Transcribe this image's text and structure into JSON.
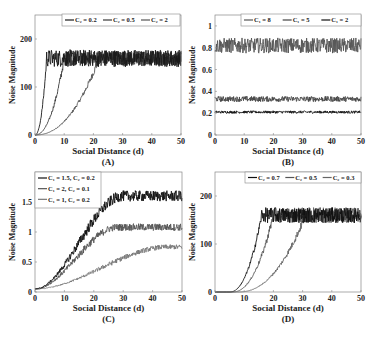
{
  "figure": {
    "panels": [
      {
        "id": "A",
        "label": "(A)",
        "xlabel": "Social Distance (d)",
        "ylabel": "Noise Magnitude",
        "box": {
          "left": 35,
          "top": 15,
          "right": 181,
          "bottom": 135
        },
        "xlim": [
          0,
          50
        ],
        "ylim": [
          0,
          250
        ],
        "xticks": [
          0,
          10,
          20,
          30,
          40,
          50
        ],
        "yticks": [
          0,
          100,
          200
        ],
        "legend": {
          "layout": "row",
          "x": 62,
          "y": 14,
          "w": 118,
          "h": 12,
          "entries": [
            "C₂ = 0.2",
            "C₂ = 0.5",
            "C₂ = 2"
          ]
        },
        "series": [
          {
            "name": "C₂ = 0.2",
            "color": "#1a1a1a",
            "plateau": 160,
            "rise_start": 0,
            "rise_end": 4,
            "noise": 18,
            "shape": "power"
          },
          {
            "name": "C₂ = 0.5",
            "color": "#3a3a3a",
            "plateau": 160,
            "rise_start": 0,
            "rise_end": 10,
            "noise": 16,
            "shape": "power"
          },
          {
            "name": "C₂ = 2",
            "color": "#555555",
            "plateau": 160,
            "rise_start": 0,
            "rise_end": 22,
            "noise": 14,
            "shape": "power"
          }
        ]
      },
      {
        "id": "B",
        "label": "(B)",
        "xlabel": "Social Distance (d)",
        "ylabel": "Noise Magnitude",
        "box": {
          "left": 215,
          "top": 15,
          "right": 361,
          "bottom": 135
        },
        "xlim": [
          0,
          50
        ],
        "ylim": [
          0,
          1.1
        ],
        "xticks": [
          0,
          10,
          20,
          30,
          40,
          50
        ],
        "yticks": [
          0,
          0.2,
          0.4,
          0.6,
          0.8,
          1
        ],
        "legend": {
          "layout": "row",
          "x": 241,
          "y": 14,
          "w": 120,
          "h": 12,
          "entries": [
            "C₁ = 8",
            "C₁ = 5",
            "C₁ = 2"
          ]
        },
        "series": [
          {
            "name": "C₁ = 8",
            "color": "#555555",
            "plateau": 0.82,
            "rise_start": 0,
            "rise_end": 0,
            "noise": 0.07,
            "shape": "flat"
          },
          {
            "name": "C₁ = 5",
            "color": "#444444",
            "plateau": 0.33,
            "rise_start": 0,
            "rise_end": 0,
            "noise": 0.025,
            "shape": "flat"
          },
          {
            "name": "C₁ = 2",
            "color": "#111111",
            "plateau": 0.21,
            "rise_start": 0,
            "rise_end": 0,
            "noise": 0.012,
            "shape": "flat"
          }
        ]
      },
      {
        "id": "C",
        "label": "(C)",
        "xlabel": "Social Distance (d)",
        "ylabel": "Noise Magnitude",
        "box": {
          "left": 35,
          "top": 172,
          "right": 182,
          "bottom": 292
        },
        "xlim": [
          0,
          50
        ],
        "ylim": [
          0,
          2
        ],
        "xticks": [
          0,
          10,
          20,
          30,
          40,
          50
        ],
        "yticks": [
          0,
          0.5,
          1,
          1.5
        ],
        "legend": {
          "layout": "column",
          "x": 35,
          "y": 172,
          "w": 66,
          "h": 36,
          "entries": [
            "C₁ = 1.5, C₂ = 0.2",
            "C₁ = 2, C₂ = 0.1",
            "C₁ = 1, C₂ = 0.2"
          ]
        },
        "series": [
          {
            "name": "C₁ = 1.5, C₂ = 0.2",
            "color": "#111111",
            "plateau": 1.6,
            "base": 0.05,
            "rise_start": 0,
            "rise_end": 30,
            "noise": 0.09,
            "shape": "sigmoid"
          },
          {
            "name": "C₁ = 2, C₂ = 0.1",
            "color": "#555555",
            "plateau": 1.08,
            "base": 0.05,
            "rise_start": 0,
            "rise_end": 28,
            "noise": 0.06,
            "shape": "sigmoid"
          },
          {
            "name": "C₁ = 1, C₂ = 0.2",
            "color": "#777777",
            "plateau": 0.75,
            "base": 0.05,
            "rise_start": 0,
            "rise_end": 45,
            "noise": 0.04,
            "shape": "sigmoid"
          }
        ]
      },
      {
        "id": "D",
        "label": "(D)",
        "xlabel": "Social Distance (d)",
        "ylabel": "Noise Magnitude",
        "box": {
          "left": 215,
          "top": 172,
          "right": 361,
          "bottom": 292
        },
        "xlim": [
          0,
          50
        ],
        "ylim": [
          0,
          250
        ],
        "xticks": [
          0,
          10,
          20,
          30,
          40,
          50
        ],
        "yticks": [
          0,
          100,
          200
        ],
        "legend": {
          "layout": "row",
          "x": 245,
          "y": 172,
          "w": 116,
          "h": 11,
          "entries": [
            "C₂ = 0.7",
            "C₂ = 0.5",
            "C₂ = 0.3"
          ]
        },
        "series": [
          {
            "name": "C₂ = 0.7",
            "color": "#111111",
            "plateau": 160,
            "rise_start": 5,
            "rise_end": 16,
            "noise": 16,
            "shape": "power"
          },
          {
            "name": "C₂ = 0.5",
            "color": "#555555",
            "plateau": 160,
            "rise_start": 6,
            "rise_end": 20,
            "noise": 16,
            "shape": "power"
          },
          {
            "name": "C₂ = 0.3",
            "color": "#666666",
            "plateau": 160,
            "rise_start": 8,
            "rise_end": 31,
            "noise": 16,
            "shape": "power"
          }
        ]
      }
    ]
  },
  "chart_data": [
    {
      "type": "line",
      "title": "(A)",
      "xlabel": "Social Distance (d)",
      "ylabel": "Noise Magnitude",
      "xlim": [
        0,
        50
      ],
      "ylim": [
        0,
        250
      ],
      "x": [
        0,
        2,
        4,
        6,
        10,
        15,
        20,
        25,
        30,
        40,
        50
      ],
      "series": [
        {
          "name": "C2 = 0.2",
          "values": [
            0,
            80,
            155,
            165,
            160,
            165,
            160,
            165,
            160,
            162,
            160
          ]
        },
        {
          "name": "C2 = 0.5",
          "values": [
            0,
            10,
            40,
            90,
            155,
            165,
            160,
            165,
            160,
            162,
            160
          ]
        },
        {
          "name": "C2 = 2",
          "values": [
            0,
            2,
            8,
            15,
            40,
            80,
            140,
            160,
            160,
            162,
            160
          ]
        }
      ],
      "legend_position": "top-right"
    },
    {
      "type": "line",
      "title": "(B)",
      "xlabel": "Social Distance (d)",
      "ylabel": "Noise Magnitude",
      "xlim": [
        0,
        50
      ],
      "ylim": [
        0,
        1.1
      ],
      "x": [
        0,
        10,
        20,
        30,
        40,
        50
      ],
      "series": [
        {
          "name": "C1 = 8",
          "values": [
            0.82,
            0.82,
            0.82,
            0.82,
            0.82,
            0.82
          ]
        },
        {
          "name": "C1 = 5",
          "values": [
            0.33,
            0.33,
            0.33,
            0.33,
            0.33,
            0.33
          ]
        },
        {
          "name": "C1 = 2",
          "values": [
            0.21,
            0.21,
            0.21,
            0.21,
            0.21,
            0.21
          ]
        }
      ],
      "legend_position": "top-right"
    },
    {
      "type": "line",
      "title": "(C)",
      "xlabel": "Social Distance (d)",
      "ylabel": "Noise Magnitude",
      "xlim": [
        0,
        50
      ],
      "ylim": [
        0,
        2
      ],
      "x": [
        0,
        5,
        10,
        15,
        20,
        25,
        30,
        40,
        50
      ],
      "series": [
        {
          "name": "C1 = 1.5, C2 = 0.2",
          "values": [
            0.05,
            0.2,
            0.5,
            0.9,
            1.25,
            1.5,
            1.6,
            1.6,
            1.6
          ]
        },
        {
          "name": "C1 = 2, C2 = 0.1",
          "values": [
            0.05,
            0.2,
            0.45,
            0.75,
            0.9,
            1.0,
            1.05,
            1.08,
            1.08
          ]
        },
        {
          "name": "C1 = 1, C2 = 0.2",
          "values": [
            0.05,
            0.1,
            0.18,
            0.28,
            0.38,
            0.48,
            0.58,
            0.7,
            0.75
          ]
        }
      ],
      "legend_position": "top-left"
    },
    {
      "type": "line",
      "title": "(D)",
      "xlabel": "Social Distance (d)",
      "ylabel": "Noise Magnitude",
      "xlim": [
        0,
        50
      ],
      "ylim": [
        0,
        250
      ],
      "x": [
        0,
        5,
        10,
        15,
        20,
        25,
        30,
        40,
        50
      ],
      "series": [
        {
          "name": "C2 = 0.7",
          "values": [
            0,
            2,
            80,
            150,
            160,
            160,
            160,
            160,
            160
          ]
        },
        {
          "name": "C2 = 0.5",
          "values": [
            0,
            1,
            20,
            110,
            155,
            160,
            160,
            160,
            160
          ]
        },
        {
          "name": "C2 = 0.3",
          "values": [
            0,
            0,
            2,
            15,
            35,
            90,
            150,
            160,
            160
          ]
        }
      ],
      "legend_position": "top-right"
    }
  ]
}
